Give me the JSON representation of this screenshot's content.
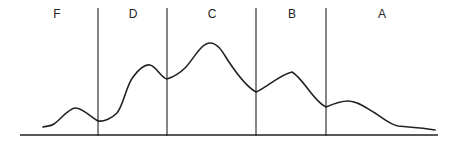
{
  "diagram": {
    "type": "segmented-curve",
    "colors": {
      "line": "#222222",
      "background": "#ffffff"
    },
    "regions": [
      {
        "label": "F",
        "x": 57
      },
      {
        "label": "D",
        "x": 133
      },
      {
        "label": "C",
        "x": 212
      },
      {
        "label": "B",
        "x": 292
      },
      {
        "label": "A",
        "x": 382
      }
    ],
    "dividers_x": [
      98,
      167,
      256,
      326
    ],
    "baseline": {
      "x1": 20,
      "x2": 438,
      "y": 135
    },
    "curve_path": "M43,127 C48,126 51,126 54,124 C62,118 68,109 75,108 C82,107 90,117 98,121 C104,122 112,118 117,113 C124,104 126,86 133,77 C139,69 145,64 150,65 C156,66 161,78 167,79 C173,77 180,73 185,68 C193,60 201,43 210,43 C219,43 224,55 229,62 C237,74 247,87 256,92 C266,88 281,74 292,72 C303,78 314,102 326,107 C333,104 340,101 348,101 C358,101 366,108 375,113 C384,119 391,125 398,126 C410,127 425,128 435,130"
  }
}
